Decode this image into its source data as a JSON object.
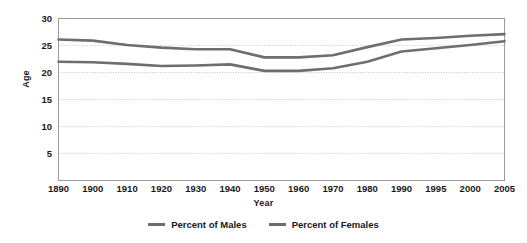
{
  "chart_data": {
    "type": "line",
    "title": "",
    "xlabel": "Year",
    "ylabel": "Age",
    "grid": true,
    "legend_position": "bottom",
    "xlim": [
      1890,
      2005
    ],
    "ylim": [
      0,
      30
    ],
    "y_ticks": [
      5,
      10,
      15,
      20,
      25,
      30
    ],
    "x_ticks": [
      "1890",
      "1900",
      "1910",
      "1920",
      "1930",
      "1940",
      "1950",
      "1960",
      "1970",
      "1980",
      "1990",
      "1995",
      "2000",
      "2005"
    ],
    "categories": [
      1890,
      1900,
      1910,
      1920,
      1930,
      1940,
      1950,
      1960,
      1970,
      1980,
      1990,
      1995,
      2000,
      2005
    ],
    "series": [
      {
        "name": "Percent of Males",
        "color": "#6e6e6e",
        "values": [
          26.1,
          25.9,
          25.1,
          24.6,
          24.3,
          24.3,
          22.8,
          22.8,
          23.2,
          24.7,
          26.1,
          26.4,
          26.8,
          27.1
        ]
      },
      {
        "name": "Percent of Females",
        "color": "#6e6e6e",
        "values": [
          22.0,
          21.9,
          21.6,
          21.2,
          21.3,
          21.5,
          20.3,
          20.3,
          20.8,
          22.0,
          23.9,
          24.5,
          25.1,
          25.8
        ]
      }
    ]
  },
  "legend": {
    "items": [
      {
        "label": "Percent of Males",
        "color": "#6e6e6e"
      },
      {
        "label": "Percent of Females",
        "color": "#6e6e6e"
      }
    ]
  },
  "axes": {
    "y_title": "Age",
    "x_title": "Year",
    "y_tick_labels": [
      "30",
      "25",
      "20",
      "15",
      "10",
      "5"
    ],
    "x_tick_labels": [
      "1890",
      "1900",
      "1910",
      "1920",
      "1930",
      "1940",
      "1950",
      "1960",
      "1970",
      "1980",
      "1990",
      "1995",
      "2000",
      "2005"
    ]
  },
  "style": {
    "plot_border_color": "#9a9a9a",
    "gridline_color": "#c8c8c8",
    "background": "#ffffff"
  }
}
